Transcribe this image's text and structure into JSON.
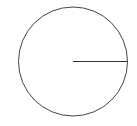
{
  "diagram": {
    "canvas": {
      "width": 137,
      "height": 126,
      "background": "#ffffff"
    },
    "circle": {
      "cx": 73,
      "cy": 61.5,
      "r": 54.5,
      "stroke": "#444444",
      "stroke_width": 1,
      "fill": "none"
    },
    "radius_line": {
      "x1": 73,
      "y1": 61.5,
      "x2": 127.5,
      "y2": 61.5,
      "stroke": "#333333",
      "stroke_width": 1
    }
  }
}
